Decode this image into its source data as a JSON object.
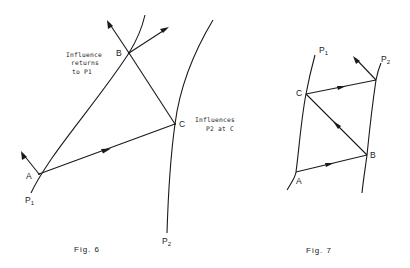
{
  "figures": [
    {
      "caption": "Fig. 6",
      "curves": [
        {
          "id": "P1",
          "label": "P",
          "subscript": "1"
        },
        {
          "id": "P2",
          "label": "P",
          "subscript": "2"
        }
      ],
      "points": [
        {
          "id": "A",
          "label": "A",
          "on": "P1"
        },
        {
          "id": "B",
          "label": "B",
          "on": "P1"
        },
        {
          "id": "C",
          "label": "C",
          "on": "P2"
        }
      ],
      "signals": [
        {
          "from": "A",
          "to": "C",
          "directed": true
        },
        {
          "from": "C",
          "to": "B",
          "directed": false
        }
      ],
      "annotations": {
        "returns": [
          "Influence",
          "returns",
          "to P1"
        ],
        "influences": [
          "Influences",
          "P2 at C"
        ]
      }
    },
    {
      "caption": "Fig. 7",
      "curves": [
        {
          "id": "P1",
          "label": "P",
          "subscript": "1"
        },
        {
          "id": "P2",
          "label": "P",
          "subscript": "2"
        }
      ],
      "points": [
        {
          "id": "A",
          "label": "A",
          "on": "P1"
        },
        {
          "id": "B",
          "label": "B",
          "on": "P2"
        },
        {
          "id": "C",
          "label": "C",
          "on": "P1"
        }
      ],
      "signals": [
        {
          "from": "A",
          "to": "B",
          "directed": true
        },
        {
          "from": "B",
          "to": "C",
          "directed": true
        },
        {
          "from": "C",
          "to": "P2",
          "directed": true
        }
      ]
    }
  ]
}
